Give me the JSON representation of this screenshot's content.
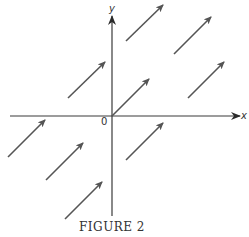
{
  "figure": {
    "caption": "FIGURE 2"
  },
  "axes": {
    "x_label": "x",
    "y_label": "y",
    "origin_label": "0",
    "color": "#3a3a3a",
    "x_axis": {
      "x1": 10,
      "y": 116,
      "x2": 240
    },
    "y_axis": {
      "x": 112,
      "y1": 216,
      "y2": 16
    }
  },
  "vectors": {
    "color": "#555555",
    "items": [
      {
        "x1": 126,
        "y1": 41,
        "x2": 163,
        "y2": 5
      },
      {
        "x1": 174,
        "y1": 54,
        "x2": 211,
        "y2": 17
      },
      {
        "x1": 188,
        "y1": 98,
        "x2": 224,
        "y2": 62
      },
      {
        "x1": 68,
        "y1": 98,
        "x2": 105,
        "y2": 62
      },
      {
        "x1": 112,
        "y1": 116,
        "x2": 149,
        "y2": 79
      },
      {
        "x1": 8,
        "y1": 157,
        "x2": 45,
        "y2": 120
      },
      {
        "x1": 46,
        "y1": 180,
        "x2": 83,
        "y2": 143
      },
      {
        "x1": 126,
        "y1": 160,
        "x2": 163,
        "y2": 123
      },
      {
        "x1": 65,
        "y1": 219,
        "x2": 102,
        "y2": 182
      }
    ]
  }
}
